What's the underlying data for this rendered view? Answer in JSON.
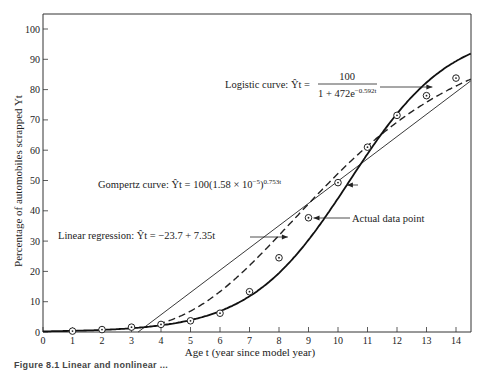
{
  "chart_data": {
    "type": "line",
    "title": "",
    "xlabel": "Age t (year since model year)",
    "ylabel": "Percentage of automobiles scrapped Y_t",
    "xlim": [
      0,
      14.5
    ],
    "ylim": [
      0,
      105
    ],
    "xticks": [
      0,
      1,
      2,
      3,
      4,
      5,
      6,
      7,
      8,
      9,
      10,
      11,
      12,
      13,
      14
    ],
    "yticks": [
      0,
      10,
      20,
      30,
      40,
      50,
      60,
      70,
      80,
      90,
      100
    ],
    "grid": false,
    "legend_position": "inline annotations",
    "series": [
      {
        "name": "Actual data point",
        "style": "circled-dot markers",
        "x": [
          1,
          2,
          3,
          4,
          5,
          6,
          7,
          8,
          9,
          10,
          11,
          12,
          13,
          14
        ],
        "values": [
          0.3,
          0.8,
          1.6,
          2.5,
          3.7,
          6.2,
          13.3,
          24.5,
          37.7,
          49.3,
          61.0,
          71.5,
          78.0,
          83.8
        ]
      },
      {
        "name": "Logistic curve",
        "style": "thick solid",
        "equation_lhs": "Logistic curve: Ŷt =",
        "numerator": "100",
        "denominator": "1 + 472e^(−0.592t)",
        "params": {
          "L": 100,
          "a": 472,
          "b": 0.592
        }
      },
      {
        "name": "Gompertz curve",
        "style": "dashed",
        "equation": "Gompertz curve: Ŷt = 100(1.58 × 10^−5)^(0.753^t)",
        "params": {
          "L": 100,
          "a": 1.58e-05,
          "b": 0.753
        }
      },
      {
        "name": "Linear regression",
        "style": "thin solid",
        "equation": "Linear regression: Ŷt = −23.7 + 7.35t",
        "params": {
          "intercept": -23.7,
          "slope": 7.35
        }
      }
    ],
    "annotations": [
      {
        "text": "Logistic curve: Ŷt = 100 / (1 + 472e^(−0.592t))",
        "arrow_to": [
          13.2,
          85
        ]
      },
      {
        "text": "Gompertz curve: Ŷt = 100(1.58 × 10^−5)^(0.753t)",
        "arrow_to": [
          10.3,
          57
        ]
      },
      {
        "text": "Linear regression: Ŷt = −23.7 + 7.35t",
        "arrow_to": [
          8.3,
          38
        ]
      },
      {
        "text": "Actual data point",
        "arrow_to": [
          9,
          37.7
        ]
      }
    ]
  },
  "labels": {
    "ylabel": "Percentage of automobiles scrapped Yt",
    "xlabel": "Age t (year since model year)",
    "logistic_lhs": "Logistic curve: Ŷt =",
    "logistic_num": "100",
    "logistic_den": "1 + 472e",
    "logistic_exp": "−0.592t",
    "gompertz": "Gompertz curve: Ŷt = 100(1.58 × 10",
    "gompertz_exp1": "−5",
    "gompertz_mid": ")",
    "gompertz_exp2": "0.753t",
    "linear": "Linear regression: Ŷt = −23.7 + 7.35t",
    "actual": "Actual data point",
    "caption": "Figure 8.1 Linear and nonlinear ..."
  }
}
